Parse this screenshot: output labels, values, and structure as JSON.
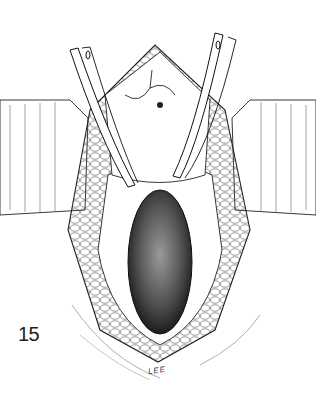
{
  "figure": {
    "number": "15",
    "signature": "LEE",
    "colors": {
      "ink": "#1a1a1a",
      "background": "#ffffff"
    }
  }
}
